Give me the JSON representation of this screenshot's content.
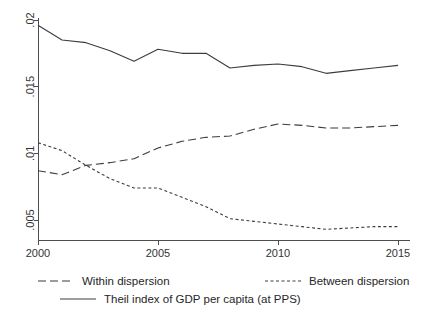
{
  "chart_data": {
    "type": "line",
    "title": "",
    "subtitle": "",
    "xlabel": "",
    "ylabel": "",
    "xlim": [
      2000,
      2015
    ],
    "xticks": [
      2000,
      2005,
      2010,
      2015
    ],
    "xtick_labels": [
      "2000",
      "2005",
      "2010",
      "2015"
    ],
    "ylim": [
      0.004,
      0.0205
    ],
    "yticks": [
      0.005,
      0.01,
      0.015,
      0.02
    ],
    "ytick_labels": [
      ".005",
      ".01",
      ".015",
      ".02"
    ],
    "grid": false,
    "legend_position": "bottom",
    "x": [
      2000,
      2001,
      2002,
      2003,
      2004,
      2005,
      2006,
      2007,
      2008,
      2009,
      2010,
      2011,
      2012,
      2013,
      2014,
      2015
    ],
    "series": [
      {
        "name": "Theil index of GDP per capita (at PPS)",
        "style": "solid",
        "color": "#3d3d3d",
        "values": [
          0.0196,
          0.0185,
          0.0183,
          0.0177,
          0.0169,
          0.0178,
          0.0175,
          0.0175,
          0.0164,
          0.0166,
          0.0167,
          0.0165,
          0.016,
          0.0162,
          0.0164,
          0.0166
        ]
      },
      {
        "name": "Within dispersion",
        "style": "long-dash",
        "color": "#3d3d3d",
        "values": [
          0.0087,
          0.0084,
          0.0091,
          0.0093,
          0.0096,
          0.0104,
          0.0109,
          0.0112,
          0.0113,
          0.0118,
          0.0122,
          0.0121,
          0.0119,
          0.0119,
          0.012,
          0.0121
        ]
      },
      {
        "name": "Between dispersion",
        "style": "short-dash",
        "color": "#3d3d3d",
        "values": [
          0.0108,
          0.0102,
          0.0091,
          0.0081,
          0.0074,
          0.0074,
          0.0067,
          0.006,
          0.0051,
          0.0049,
          0.0047,
          0.0045,
          0.0043,
          0.0044,
          0.0045,
          0.0045
        ]
      }
    ],
    "legend": [
      {
        "label": "Within dispersion",
        "style": "long-dash"
      },
      {
        "label": "Between dispersion",
        "style": "short-dash"
      },
      {
        "label": "Theil index of GDP per capita (at PPS)",
        "style": "solid"
      }
    ]
  }
}
